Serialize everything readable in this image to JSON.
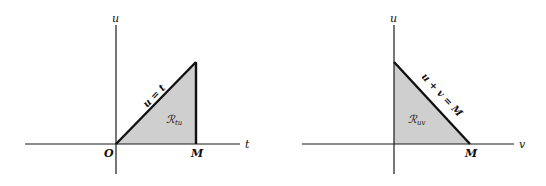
{
  "diagrams": [
    {
      "id": "left",
      "vertical_axis_label": "u",
      "horizontal_axis_label": "t",
      "origin_label": "O",
      "m_label": "M",
      "line_label": "u = t",
      "region_label": "ℛ",
      "region_subscript": "tu",
      "region_color": "#cfcfcf"
    },
    {
      "id": "right",
      "vertical_axis_label": "u",
      "horizontal_axis_label": "v",
      "m_label": "M",
      "line_label": "u + v = M",
      "region_label": "ℛ",
      "region_subscript": "uv",
      "region_color": "#cfcfcf"
    }
  ]
}
